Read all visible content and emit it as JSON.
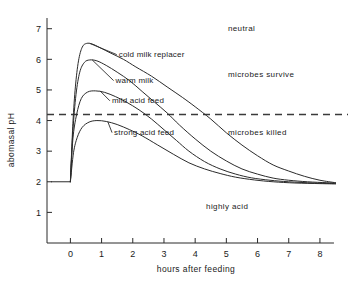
{
  "chart_data": {
    "type": "line",
    "title": "",
    "xlabel": "hours after feeding",
    "ylabel": "abomasal pH",
    "xlim": [
      -0.75,
      8.9
    ],
    "ylim": [
      0,
      7.35
    ],
    "grid": false,
    "legend_position": "inline-labels",
    "x_ticks": [
      "0",
      "1",
      "2",
      "3",
      "4",
      "5",
      "6",
      "7",
      "8"
    ],
    "x_tick_values": [
      0,
      1,
      2,
      3,
      4,
      5,
      6,
      7,
      8
    ],
    "y_ticks": [
      "1",
      "2",
      "3",
      "4",
      "5",
      "6",
      "7"
    ],
    "y_tick_values": [
      1,
      2,
      3,
      4,
      5,
      6,
      7
    ],
    "baseline": {
      "label": "resting abomasal pH",
      "value": 2.0,
      "x_from": -0.62,
      "x_to": 0.0
    },
    "threshold_line": {
      "label": "microbial survival threshold",
      "value": 4.2,
      "style": "dashed",
      "x_from": -0.75,
      "x_to": 8.9
    },
    "series": [
      {
        "name": "cold milk replacer",
        "label": "cold milk replacer",
        "label_x": 1.55,
        "label_y": 6.07,
        "leader_to_x": 0.62,
        "leader_to_y": 6.52,
        "points": [
          [
            0.0,
            2.0
          ],
          [
            0.08,
            3.9
          ],
          [
            0.16,
            5.1
          ],
          [
            0.26,
            5.95
          ],
          [
            0.38,
            6.4
          ],
          [
            0.52,
            6.52
          ],
          [
            0.7,
            6.5
          ],
          [
            0.95,
            6.38
          ],
          [
            1.3,
            6.2
          ],
          [
            1.7,
            6.0
          ],
          [
            2.1,
            5.75
          ],
          [
            2.6,
            5.45
          ],
          [
            3.1,
            5.1
          ],
          [
            3.6,
            4.75
          ],
          [
            4.0,
            4.45
          ],
          [
            4.5,
            4.05
          ],
          [
            5.0,
            3.6
          ],
          [
            5.5,
            3.2
          ],
          [
            6.0,
            2.85
          ],
          [
            6.5,
            2.55
          ],
          [
            7.0,
            2.35
          ],
          [
            7.5,
            2.18
          ],
          [
            8.0,
            2.05
          ],
          [
            8.5,
            1.97
          ]
        ]
      },
      {
        "name": "warm milk",
        "label": "warm milk",
        "label_x": 1.45,
        "label_y": 5.22,
        "leader_to_x": 0.7,
        "leader_to_y": 5.98,
        "points": [
          [
            0.0,
            2.0
          ],
          [
            0.08,
            3.65
          ],
          [
            0.18,
            4.85
          ],
          [
            0.3,
            5.58
          ],
          [
            0.45,
            5.9
          ],
          [
            0.62,
            5.98
          ],
          [
            0.85,
            5.95
          ],
          [
            1.15,
            5.8
          ],
          [
            1.5,
            5.58
          ],
          [
            1.9,
            5.3
          ],
          [
            2.3,
            4.95
          ],
          [
            2.7,
            4.6
          ],
          [
            3.1,
            4.25
          ],
          [
            3.5,
            3.85
          ],
          [
            4.0,
            3.4
          ],
          [
            4.5,
            3.0
          ],
          [
            5.0,
            2.68
          ],
          [
            5.5,
            2.42
          ],
          [
            6.0,
            2.25
          ],
          [
            6.5,
            2.12
          ],
          [
            7.0,
            2.05
          ],
          [
            7.6,
            2.0
          ],
          [
            8.2,
            1.97
          ],
          [
            8.5,
            1.96
          ]
        ]
      },
      {
        "name": "mild acid feed",
        "label": "mild acid feed",
        "label_x": 1.33,
        "label_y": 4.56,
        "leader_to_x": 0.95,
        "leader_to_y": 4.97,
        "points": [
          [
            0.0,
            2.0
          ],
          [
            0.08,
            3.4
          ],
          [
            0.2,
            4.2
          ],
          [
            0.35,
            4.72
          ],
          [
            0.55,
            4.93
          ],
          [
            0.8,
            4.97
          ],
          [
            1.1,
            4.92
          ],
          [
            1.45,
            4.78
          ],
          [
            1.8,
            4.6
          ],
          [
            2.2,
            4.35
          ],
          [
            2.6,
            4.05
          ],
          [
            3.0,
            3.7
          ],
          [
            3.4,
            3.35
          ],
          [
            3.8,
            3.0
          ],
          [
            4.3,
            2.66
          ],
          [
            4.8,
            2.42
          ],
          [
            5.3,
            2.25
          ],
          [
            5.8,
            2.13
          ],
          [
            6.4,
            2.05
          ],
          [
            7.0,
            2.0
          ],
          [
            7.8,
            1.96
          ],
          [
            8.5,
            1.94
          ]
        ]
      },
      {
        "name": "strong acid feed",
        "label": "strong acid feed",
        "label_x": 1.4,
        "label_y": 3.52,
        "leader_to_x": 1.2,
        "leader_to_y": 3.96,
        "points": [
          [
            0.0,
            2.0
          ],
          [
            0.1,
            2.95
          ],
          [
            0.22,
            3.45
          ],
          [
            0.38,
            3.78
          ],
          [
            0.6,
            3.95
          ],
          [
            0.85,
            4.0
          ],
          [
            1.15,
            3.97
          ],
          [
            1.5,
            3.87
          ],
          [
            1.9,
            3.7
          ],
          [
            2.3,
            3.5
          ],
          [
            2.8,
            3.2
          ],
          [
            3.3,
            2.9
          ],
          [
            3.8,
            2.62
          ],
          [
            4.3,
            2.42
          ],
          [
            4.8,
            2.27
          ],
          [
            5.3,
            2.15
          ],
          [
            5.9,
            2.06
          ],
          [
            6.5,
            2.0
          ],
          [
            7.2,
            1.96
          ],
          [
            8.0,
            1.94
          ],
          [
            8.5,
            1.93
          ]
        ]
      }
    ],
    "zone_annotations": [
      {
        "text": "neutral",
        "x": 5.05,
        "y": 6.92
      },
      {
        "text": "microbes survive",
        "x": 5.05,
        "y": 5.42
      },
      {
        "text": "microbes killed",
        "x": 5.05,
        "y": 3.52
      },
      {
        "text": "highly acid",
        "x": 4.35,
        "y": 1.12
      }
    ]
  }
}
